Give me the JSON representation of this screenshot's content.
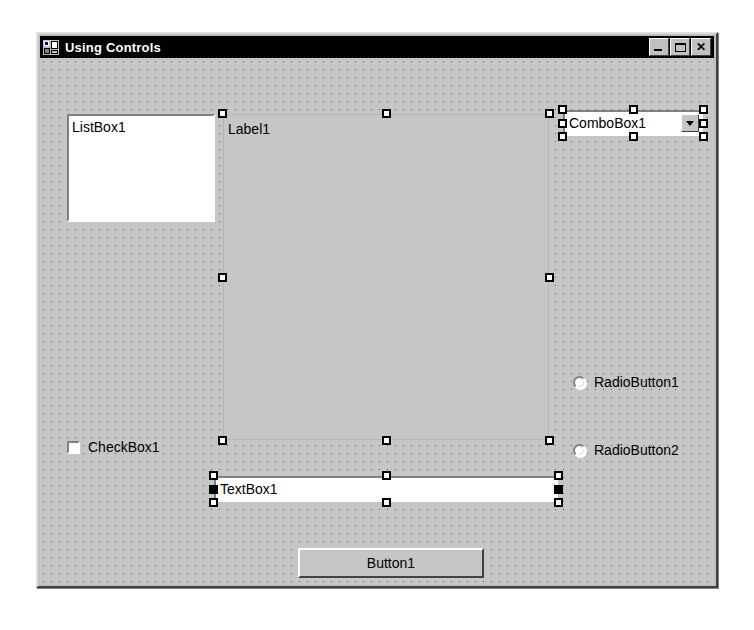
{
  "window": {
    "title": "Using Controls",
    "icon": "application-icon",
    "buttons": [
      {
        "name": "minimize-button",
        "label": "_",
        "glyph": "minimize-icon"
      },
      {
        "name": "maximize-button",
        "label": "□",
        "glyph": "maximize-icon"
      },
      {
        "name": "close-button",
        "label": "×",
        "glyph": "close-icon"
      }
    ]
  },
  "colors": {
    "face": "#c0c0c0",
    "surface": "#c6c6c6",
    "titlebar": "#000000",
    "titlebar_text": "#ffffff",
    "field": "#ffffff",
    "shadow": "#808080",
    "dark_shadow": "#404040",
    "highlight": "#ffffff",
    "handle_fill": "#ffffff",
    "handle_border": "#000000",
    "handle_active": "#000000"
  },
  "controls": {
    "listbox": {
      "name": "ListBox1",
      "text": "ListBox1",
      "selected": false
    },
    "label": {
      "name": "Label1",
      "text": "Label1",
      "selected": true,
      "handles": 8
    },
    "combobox": {
      "name": "ComboBox1",
      "text": "ComboBox1",
      "selected": true,
      "handles": 8,
      "dropdown_icon": "chevron-down-icon"
    },
    "radio1": {
      "name": "RadioButton1",
      "text": "RadioButton1",
      "checked": false
    },
    "radio2": {
      "name": "RadioButton2",
      "text": "RadioButton2",
      "checked": false
    },
    "checkbox": {
      "name": "CheckBox1",
      "text": "CheckBox1",
      "checked": false
    },
    "textbox": {
      "name": "TextBox1",
      "text": "TextBox1",
      "selected": true,
      "handles": 8,
      "active_handles": "left-middle,right-middle"
    },
    "button": {
      "name": "Button1",
      "text": "Button1",
      "selected": false
    }
  }
}
